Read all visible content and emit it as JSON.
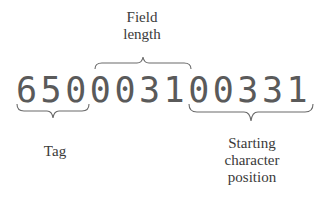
{
  "diagram": {
    "title": "",
    "record": {
      "value": "650003100331",
      "digits": [
        "6",
        "5",
        "0",
        "0",
        "0",
        "3",
        "1",
        "0",
        "0",
        "3",
        "3",
        "1"
      ]
    },
    "segments": [
      {
        "name": "tag",
        "label": "Tag",
        "digits": "650",
        "brace": "below"
      },
      {
        "name": "field_length",
        "label": "Field\nlength",
        "digits": "0031",
        "brace": "above"
      },
      {
        "name": "starting_position",
        "label": "Starting\ncharacter\nposition",
        "digits": "00331",
        "brace": "below"
      }
    ],
    "labels": {
      "field_length": "Field\nlength",
      "tag": "Tag",
      "starting_position": "Starting\ncharacter\nposition"
    },
    "colors": {
      "text": "#3a3a3a",
      "digits": "#5a5a5a",
      "brace": "#6a6a6a",
      "background": "#ffffff"
    }
  }
}
